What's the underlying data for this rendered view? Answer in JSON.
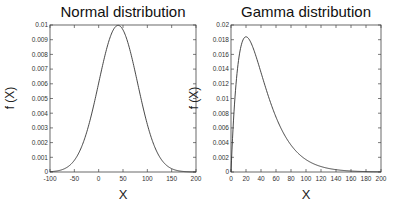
{
  "chart_data": [
    {
      "type": "line",
      "title": "Normal distribution",
      "xlabel": "X",
      "ylabel": "f (X)",
      "xlim": [
        -100,
        200
      ],
      "ylim": [
        0,
        0.01
      ],
      "xticks": [
        -100,
        -50,
        0,
        50,
        100,
        150,
        200
      ],
      "yticks": [
        0,
        0.001,
        0.002,
        0.003,
        0.004,
        0.005,
        0.006,
        0.007,
        0.008,
        0.009,
        0.01
      ],
      "xtick_labels": [
        "-100",
        "-50",
        "0",
        "50",
        "100",
        "150",
        "200"
      ],
      "ytick_labels": [
        "0",
        "0.001",
        "0.002",
        "0.003",
        "0.004",
        "0.005",
        "0.006",
        "0.007",
        "0.008",
        "0.009",
        "0.01"
      ],
      "grid": false,
      "legend": null,
      "distribution": {
        "name": "normal",
        "mean": 40,
        "std": 40
      },
      "series": [
        {
          "name": "Normal pdf",
          "x": [
            -100,
            -80,
            -60,
            -40,
            -20,
            0,
            20,
            40,
            60,
            80,
            100,
            120,
            140,
            160,
            180,
            200
          ],
          "y": [
            2e-05,
            9e-05,
            0.00044,
            0.00135,
            0.00324,
            0.00605,
            0.0088,
            0.00997,
            0.0088,
            0.00605,
            0.00324,
            0.00135,
            0.00044,
            9e-05,
            2e-05,
            3e-06
          ]
        }
      ]
    },
    {
      "type": "line",
      "title": "Gamma distribution",
      "xlabel": "X",
      "ylabel": "f (X)",
      "xlim": [
        0,
        200
      ],
      "ylim": [
        0,
        0.02
      ],
      "xticks": [
        0,
        20,
        40,
        60,
        80,
        100,
        120,
        140,
        160,
        180,
        200
      ],
      "yticks": [
        0,
        0.002,
        0.004,
        0.006,
        0.008,
        0.01,
        0.012,
        0.014,
        0.016,
        0.018,
        0.02
      ],
      "xtick_labels": [
        "0",
        "20",
        "40",
        "60",
        "80",
        "100",
        "120",
        "140",
        "160",
        "180",
        "200"
      ],
      "ytick_labels": [
        "0",
        "0.002",
        "0.004",
        "0.006",
        "0.008",
        "0.01",
        "0.012",
        "0.014",
        "0.016",
        "0.018",
        "0.02"
      ],
      "grid": false,
      "legend": null,
      "distribution": {
        "name": "gamma",
        "shape": 2,
        "scale": 20
      },
      "series": [
        {
          "name": "Gamma pdf",
          "x": [
            0,
            5,
            10,
            20,
            30,
            40,
            50,
            60,
            80,
            100,
            120,
            140,
            160,
            180,
            200
          ],
          "y": [
            0,
            0.00974,
            0.01516,
            0.01839,
            0.01673,
            0.01353,
            0.01026,
            0.00747,
            0.00366,
            0.00168,
            0.00074,
            0.00032,
            0.00013,
            6e-05,
            2e-05
          ]
        }
      ]
    }
  ],
  "style": {
    "line_color": "#333333",
    "axis_color": "#444444",
    "background": "#ffffff"
  }
}
